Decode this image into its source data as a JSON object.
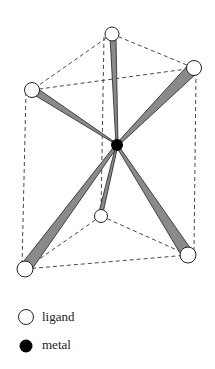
{
  "diagram": {
    "ligand_positions": {
      "top_back": [
        112,
        34
      ],
      "top_left": [
        32,
        90
      ],
      "top_right": [
        194,
        68
      ],
      "bottom_mid": [
        101,
        216
      ],
      "bottom_left": [
        25,
        269
      ],
      "bottom_right": [
        188,
        255
      ]
    },
    "metal_position": [
      117,
      145
    ],
    "colors": {
      "bond_fill": "#8a8a8a",
      "ligand_fill": "#ffffff",
      "metal_fill": "#000000",
      "edge_stroke": "#333333"
    }
  },
  "legend": {
    "items": [
      {
        "label": "ligand",
        "symbol": "open-circle"
      },
      {
        "label": "metal",
        "symbol": "filled-circle"
      }
    ]
  }
}
